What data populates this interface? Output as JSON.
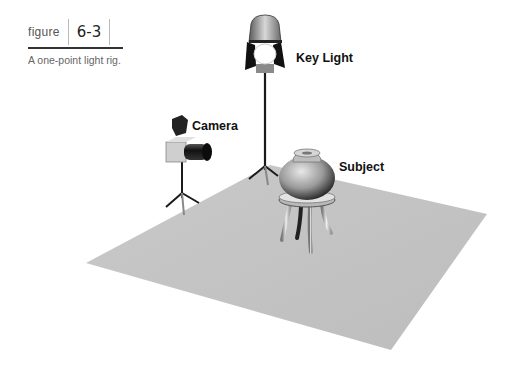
{
  "figure": {
    "word": "figure",
    "number": "6-3",
    "caption": "A one-point light rig."
  },
  "labels": {
    "key_light": "Key Light",
    "camera": "Camera",
    "subject": "Subject"
  },
  "colors": {
    "floor": "#c4c4c4",
    "stand": "#1a1a1a",
    "label_text": "#111111"
  }
}
